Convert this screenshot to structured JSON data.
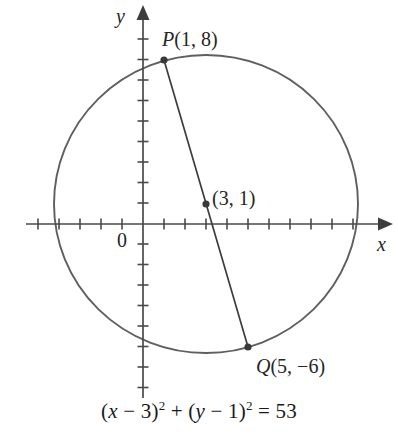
{
  "figure": {
    "background_color": "#ffffff",
    "stroke_color": "#595959",
    "text_color": "#262626"
  },
  "axes": {
    "x_axis_label": "x",
    "y_axis_label": "y",
    "origin_label": "0",
    "x_axis_pixel_y": 224,
    "y_axis_pixel_x": 143,
    "unit_px_x": 21,
    "unit_px_y": 20.5,
    "x_tick_min": -5,
    "x_tick_max": 10,
    "y_tick_min": -8,
    "y_tick_max": 9,
    "tick_length": 11,
    "grid": false
  },
  "points": [
    {
      "id": "P",
      "name": "P",
      "label_name": "P",
      "label_coords": "(1, 8)",
      "x": 1,
      "y": 8,
      "px": 164,
      "py": 60
    },
    {
      "id": "center",
      "name": "",
      "label_name": "",
      "label_coords": "(3, 1)",
      "x": 3,
      "y": 1,
      "px": 206,
      "py": 204
    },
    {
      "id": "Q",
      "name": "Q",
      "label_name": "Q",
      "label_coords": "(5, −6)",
      "x": 5,
      "y": -6,
      "px": 248,
      "py": 347
    }
  ],
  "circle": {
    "center_x": 3,
    "center_y": 1,
    "radius_squared": 53,
    "radius": 7.2801,
    "center_px": 206,
    "center_py": 204,
    "radius_px_x": 153,
    "radius_px_y": 149
  },
  "diameter_segment": {
    "from": "P",
    "to": "Q"
  },
  "equation": {
    "full_text": "(x − 3)² + (y − 1)² = 53",
    "lhs_open_1": "(",
    "var_x": "x",
    "minus_1": " − 3)",
    "exp_1": "2",
    "plus": " + ",
    "lhs_open_2": "(",
    "var_y": "y",
    "minus_2": " − 1)",
    "exp_2": "2",
    "equals": " = 53"
  }
}
